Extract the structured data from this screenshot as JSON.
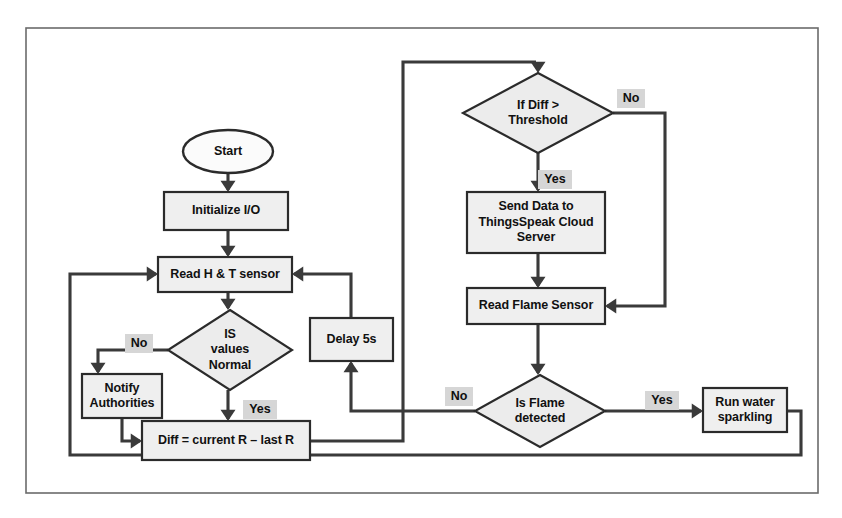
{
  "diagram": {
    "colors": {
      "frame_border": "#6b6b6b",
      "node_fill": "#efefef",
      "node_border": "#2b2b2b",
      "connector": "#3a3a3a",
      "label_badge": "#d6d6d6",
      "text": "#111111",
      "background": "#ffffff"
    },
    "frame": {
      "x": 26,
      "y": 28,
      "width": 792,
      "height": 465
    },
    "nodes": [
      {
        "id": "start",
        "type": "terminator",
        "lines": [
          "Start"
        ],
        "x": 183,
        "y": 130,
        "width": 90,
        "height": 43
      },
      {
        "id": "initialize-io",
        "type": "process",
        "lines": [
          "Initialize I/O"
        ],
        "x": 164,
        "y": 192,
        "width": 124,
        "height": 38
      },
      {
        "id": "read-ht-sensor",
        "type": "process",
        "lines": [
          "Read H & T sensor"
        ],
        "x": 158,
        "y": 257,
        "width": 134,
        "height": 35
      },
      {
        "id": "is-values-normal",
        "type": "decision",
        "lines": [
          "IS",
          "values",
          "Normal"
        ],
        "x": 168,
        "y": 310,
        "width": 124,
        "height": 80
      },
      {
        "id": "notify-authorities",
        "type": "process",
        "lines": [
          "Notify",
          "Authorities"
        ],
        "x": 82,
        "y": 374,
        "width": 80,
        "height": 44
      },
      {
        "id": "diff-calc",
        "type": "process",
        "lines": [
          "Diff = current R – last R"
        ],
        "x": 142,
        "y": 421,
        "width": 168,
        "height": 39
      },
      {
        "id": "delay-5s",
        "type": "process",
        "lines": [
          "Delay 5s"
        ],
        "x": 310,
        "y": 318,
        "width": 83,
        "height": 43
      },
      {
        "id": "if-diff-threshold",
        "type": "decision",
        "lines": [
          "If Diff >",
          "Threshold"
        ],
        "x": 463,
        "y": 73,
        "width": 150,
        "height": 80
      },
      {
        "id": "send-data-cloud",
        "type": "process",
        "lines": [
          "Send Data to",
          "ThingsSpeak Cloud",
          "Server"
        ],
        "x": 467,
        "y": 192,
        "width": 138,
        "height": 61
      },
      {
        "id": "read-flame-sensor",
        "type": "process",
        "lines": [
          "Read Flame Sensor"
        ],
        "x": 467,
        "y": 288,
        "width": 138,
        "height": 36
      },
      {
        "id": "is-flame-detected",
        "type": "decision",
        "lines": [
          "Is Flame",
          "detected"
        ],
        "x": 475,
        "y": 375,
        "width": 130,
        "height": 72
      },
      {
        "id": "run-water-sparkling",
        "type": "process",
        "lines": [
          "Run water",
          "sparkling"
        ],
        "x": 703,
        "y": 388,
        "width": 84,
        "height": 44
      }
    ],
    "branch_labels": [
      {
        "id": "no-values-normal",
        "text": "No",
        "x": 125,
        "y": 334
      },
      {
        "id": "yes-values-normal",
        "text": "Yes",
        "x": 243,
        "y": 400
      },
      {
        "id": "no-diff-threshold",
        "text": "No",
        "x": 617,
        "y": 89
      },
      {
        "id": "yes-diff-threshold",
        "text": "Yes",
        "x": 538,
        "y": 170
      },
      {
        "id": "no-flame-detected",
        "text": "No",
        "x": 445,
        "y": 387
      },
      {
        "id": "yes-flame-detected",
        "text": "Yes",
        "x": 645,
        "y": 391
      }
    ],
    "connectors": [
      {
        "id": "start-to-initialize",
        "points": "228,173 228,190",
        "arrow": "down",
        "ax": 228,
        "ay": 192
      },
      {
        "id": "initialize-to-read-ht",
        "points": "228,230 228,255",
        "arrow": "down",
        "ax": 228,
        "ay": 257
      },
      {
        "id": "read-ht-to-decision",
        "points": "228,292 228,308",
        "arrow": "down",
        "ax": 228,
        "ay": 310
      },
      {
        "id": "values-no-to-notify",
        "points": "168,350 98,350 98,372",
        "arrow": "down",
        "ax": 98,
        "ay": 374
      },
      {
        "id": "values-yes-to-diff",
        "points": "228,390 228,419",
        "arrow": "down",
        "ax": 228,
        "ay": 421
      },
      {
        "id": "notify-to-diff",
        "points": "122,418 122,441 140,441",
        "arrow": "right",
        "ax": 142,
        "ay": 441
      },
      {
        "id": "diff-to-riser",
        "points": "310,441 403,441 403,62 536,62",
        "arrow": "down",
        "ax": 538,
        "ay": 73
      },
      {
        "id": "diff-threshold-yes-to-send",
        "points": "538,153 538,190",
        "arrow": "down",
        "ax": 538,
        "ay": 192
      },
      {
        "id": "send-to-read-flame",
        "points": "538,253 538,286",
        "arrow": "down",
        "ax": 538,
        "ay": 288
      },
      {
        "id": "diff-threshold-no-to-flame",
        "points": "613,113 665,113 665,306 607,306",
        "arrow": "left",
        "ax": 605,
        "ay": 306
      },
      {
        "id": "read-flame-to-decision",
        "points": "538,324 538,373",
        "arrow": "down",
        "ax": 538,
        "ay": 375
      },
      {
        "id": "flame-no-to-delay",
        "points": "475,411 351,411 351,363",
        "arrow": "up",
        "ax": 351,
        "ay": 361
      },
      {
        "id": "delay-to-read-ht",
        "points": "351,318 351,274 294,274",
        "arrow": "left",
        "ax": 292,
        "ay": 274
      },
      {
        "id": "flame-yes-to-water",
        "points": "605,411 701,411",
        "arrow": "right",
        "ax": 703,
        "ay": 411
      },
      {
        "id": "water-to-bottom-return",
        "points": "787,411 801,411 801,455 70,455 70,274 156,274",
        "arrow": "right",
        "ax": 158,
        "ay": 274
      }
    ]
  }
}
